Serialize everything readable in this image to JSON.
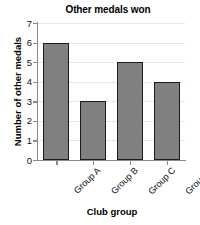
{
  "chart_data": {
    "type": "bar",
    "title": "Other medals won",
    "xlabel": "Club group",
    "ylabel": "Number of other medals",
    "categories": [
      "Group A",
      "Group B",
      "Group C",
      "Group D"
    ],
    "values": [
      6,
      3,
      5,
      4
    ],
    "ylim": [
      0,
      7
    ],
    "yticks": [
      0,
      1,
      2,
      3,
      4,
      5,
      6,
      7
    ],
    "ytick_labels": [
      "0",
      "1",
      "2",
      "3",
      "4",
      "5",
      "6",
      "7"
    ],
    "grid": true,
    "grid_axis": "y",
    "legend": false,
    "xtick_rotation": -45,
    "colors": {
      "bar_fill": "#808080",
      "bar_edge": "#1c1c1c",
      "gridline": "#e8e8e8",
      "spine": "#8a8a8a",
      "text": "#111111",
      "background": "#ffffff"
    }
  }
}
